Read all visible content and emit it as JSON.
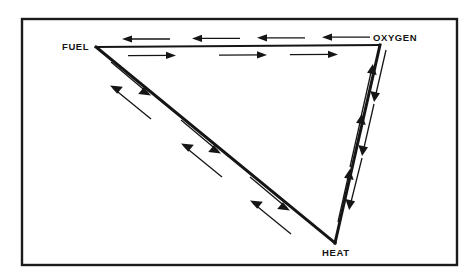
{
  "figure": {
    "type": "fire-triangle-diagram",
    "background_color": "#ffffff",
    "ink_color": "#151515",
    "border": {
      "name": "outer-frame",
      "x": 22,
      "y": 19,
      "width": 435,
      "height": 246,
      "stroke_width": 2.4,
      "color": "#1b1b1b"
    },
    "nodes": [
      {
        "id": "fuel",
        "label": "FUEL",
        "vertex_x": 96,
        "vertex_y": 47,
        "label_x": 62,
        "label_y": 50,
        "anchor": "start"
      },
      {
        "id": "oxygen",
        "label": "OXYGEN",
        "vertex_x": 380,
        "vertex_y": 45,
        "label_x": 373,
        "label_y": 41,
        "anchor": "start"
      },
      {
        "id": "heat",
        "label": "HEAT",
        "vertex_x": 335,
        "vertex_y": 243,
        "label_x": 322,
        "label_y": 256,
        "anchor": "start"
      }
    ],
    "edges": [
      {
        "id": "fuel-oxygen",
        "name": "top-edge",
        "from": "fuel",
        "to": "oxygen",
        "stroke_width": 2.2
      },
      {
        "id": "oxygen-heat",
        "name": "right-edge",
        "from": "oxygen",
        "to": "heat",
        "stroke_width": 3.0
      },
      {
        "id": "fuel-heat",
        "name": "left-diagonal-edge",
        "from": "fuel",
        "to": "heat",
        "stroke_width": 3.0
      }
    ],
    "arrow_groups": [
      {
        "id": "top-left-flow",
        "name": "arrows-oxygen-to-fuel",
        "edge": "fuel-oxygen",
        "direction": "leftward",
        "count": 4,
        "side": "above"
      },
      {
        "id": "top-right-flow",
        "name": "arrows-fuel-to-oxygen",
        "edge": "fuel-oxygen",
        "direction": "rightward",
        "count": 3,
        "side": "below"
      },
      {
        "id": "right-up-flow",
        "name": "arrows-heat-to-oxygen",
        "edge": "oxygen-heat",
        "direction": "upward",
        "count": 3,
        "side": "left"
      },
      {
        "id": "right-down-flow",
        "name": "arrows-oxygen-to-heat",
        "edge": "oxygen-heat",
        "direction": "downward",
        "count": 3,
        "side": "right"
      },
      {
        "id": "diagonal-up-flow",
        "name": "arrows-heat-to-fuel",
        "edge": "fuel-heat",
        "direction": "up-left",
        "count": 3,
        "side": "left"
      },
      {
        "id": "diagonal-down-flow",
        "name": "arrows-fuel-to-heat",
        "edge": "fuel-heat",
        "direction": "down-right",
        "count": 3,
        "side": "right"
      }
    ]
  }
}
